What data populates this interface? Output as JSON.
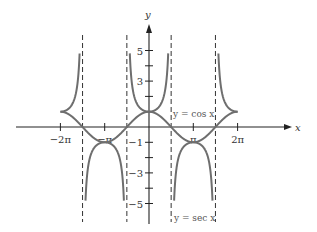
{
  "chart_data": {
    "type": "line",
    "title": "",
    "xlabel": "x",
    "ylabel": "y",
    "xlim": [
      -6.6,
      6.6
    ],
    "ylim": [
      -5.8,
      6.2
    ],
    "grid": false,
    "x_ticks": [
      {
        "value": -6.2832,
        "label": "−2π"
      },
      {
        "value": -3.1416,
        "label": "−π"
      },
      {
        "value": 3.1416,
        "label": "π"
      },
      {
        "value": 6.2832,
        "label": "2π"
      }
    ],
    "y_ticks": [
      {
        "value": 5,
        "label": "5"
      },
      {
        "value": 4,
        "label": ""
      },
      {
        "value": 3,
        "label": "3"
      },
      {
        "value": 2,
        "label": ""
      },
      {
        "value": 1,
        "label": ""
      },
      {
        "value": -1,
        "label": "−1"
      },
      {
        "value": -2,
        "label": ""
      },
      {
        "value": -3,
        "label": "−3"
      },
      {
        "value": -4,
        "label": ""
      },
      {
        "value": -5,
        "label": "−5"
      }
    ],
    "asymptotes": [
      -4.7124,
      -1.5708,
      1.5708,
      4.7124
    ],
    "series": [
      {
        "name": "y = cos x",
        "function": "cos",
        "domain": [
          -6.2832,
          6.2832
        ]
      },
      {
        "name": "y = sec x",
        "function": "sec",
        "domain": [
          -6.2832,
          6.2832
        ],
        "clip": 5
      }
    ],
    "annotations": [
      {
        "text": "y = cos x",
        "near": [
          1.6,
          0.9
        ]
      },
      {
        "text": "y = sec x",
        "near": [
          1.6,
          -5.8
        ]
      }
    ]
  },
  "colors": {
    "curve": "#6e6e6e",
    "axis": "#222222",
    "asymptote": "#333333"
  }
}
